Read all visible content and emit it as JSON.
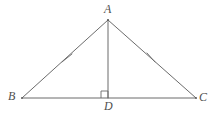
{
  "figure": {
    "kind": "geometry-diagram",
    "background_color": "#ffffff",
    "stroke_color": "#5a5a5a",
    "label_color": "#4f4f4f",
    "stroke_width": 0.9
  },
  "points": {
    "A": {
      "label": "A",
      "x": 108,
      "y": 20,
      "label_x": 104,
      "label_y": 3
    },
    "B": {
      "label": "B",
      "x": 22,
      "y": 98,
      "label_x": 8,
      "label_y": 90
    },
    "C": {
      "label": "C",
      "x": 196,
      "y": 98,
      "label_x": 199,
      "label_y": 91
    },
    "D": {
      "label": "D",
      "x": 108,
      "y": 98,
      "label_x": 104,
      "label_y": 100
    }
  },
  "segments": [
    {
      "name": "AB",
      "from": "A",
      "to": "B",
      "x1": 108,
      "y1": 20,
      "x2": 22,
      "y2": 98
    },
    {
      "name": "AC",
      "from": "A",
      "to": "C",
      "x1": 108,
      "y1": 20,
      "x2": 196,
      "y2": 98
    },
    {
      "name": "BC",
      "from": "B",
      "to": "C",
      "x1": 22,
      "y1": 98,
      "x2": 196,
      "y2": 98
    },
    {
      "name": "AD",
      "from": "A",
      "to": "D",
      "x1": 108,
      "y1": 20,
      "x2": 108,
      "y2": 98
    }
  ],
  "tick_marks": [
    {
      "name": "tick-AB",
      "on_segment": "AB",
      "count": 1,
      "x1": 62,
      "y1": 62,
      "x2": 72,
      "y2": 54
    },
    {
      "name": "tick-AC",
      "on_segment": "AC",
      "count": 1,
      "x1": 147,
      "y1": 53,
      "x2": 155,
      "y2": 62
    }
  ],
  "right_angle": {
    "name": "right-angle-at-D",
    "at_point": "D",
    "size": 7,
    "x": 101,
    "y": 91
  }
}
